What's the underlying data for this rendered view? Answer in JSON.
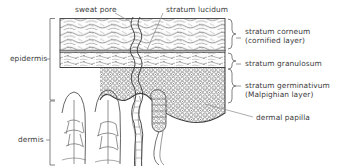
{
  "figure": {
    "ink_color": "#4a4a4a",
    "text_color": "#3b3b3b",
    "background": "#ffffff"
  },
  "labels": {
    "sweat_pore": "sweat pore",
    "stratum_lucidum": "stratum lucidum",
    "stratum_corneum_line1": "stratum corneum",
    "stratum_corneum_line2": "(cornified layer)",
    "stratum_granulosum": "stratum granulosum",
    "stratum_germinativum_line1": "stratum germinativum",
    "stratum_germinativum_line2": "(Malpighian layer)",
    "dermal_papilla": "dermal papilla",
    "epidermis": "epidermis",
    "dermis": "dermis"
  },
  "structure": {
    "regions": [
      {
        "name": "epidermis",
        "sublayers": [
          "stratum corneum (cornified layer)",
          "stratum lucidum",
          "stratum granulosum",
          "stratum germinativum (Malpighian layer)"
        ]
      },
      {
        "name": "dermis",
        "features": [
          "dermal papilla",
          "sweat gland"
        ]
      }
    ],
    "features": [
      "sweat pore",
      "dermal papilla"
    ]
  }
}
